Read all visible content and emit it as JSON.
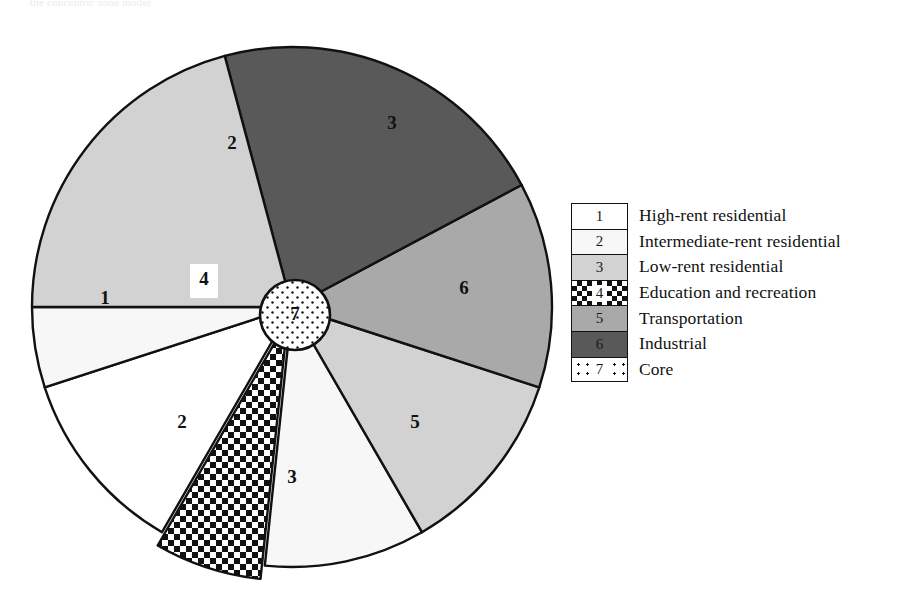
{
  "caption": "the concentric zone model",
  "chart_data": {
    "type": "pie",
    "center_label": "7",
    "core_category": "Core",
    "categories": [
      "1",
      "2",
      "3",
      "4",
      "5",
      "6",
      "7"
    ],
    "legend_position": "right",
    "grid": false,
    "sectors": [
      {
        "id": "1",
        "label": "High-rent residential",
        "start_deg": 210,
        "end_deg": 252,
        "value": 42,
        "fill": "#ffffff",
        "pattern": "solid",
        "label_x": 105,
        "label_y": 300
      },
      {
        "id": "2",
        "label": "Intermediate-rent residential",
        "start_deg": 252,
        "end_deg": 270,
        "value": 18,
        "fill": "#f7f7f7",
        "pattern": "solid",
        "label_x": 232,
        "label_y": 145
      },
      {
        "id": "4",
        "label": "Education and recreation",
        "start_deg": 186,
        "end_deg": 210,
        "value": 24,
        "fill": "#ffffff",
        "pattern": "checker",
        "label_x": 204,
        "label_y": 281,
        "exploded": true
      },
      {
        "id": "2b",
        "label": "Intermediate-rent residential",
        "start_deg": 150,
        "end_deg": 186,
        "value": 36,
        "fill": "#f7f7f7",
        "pattern": "solid",
        "label_x": 182,
        "label_y": 424
      },
      {
        "id": "3b",
        "label": "Low-rent residential",
        "start_deg": 108,
        "end_deg": 150,
        "value": 42,
        "fill": "#d2d2d2",
        "pattern": "solid",
        "label_x": 292,
        "label_y": 479
      },
      {
        "id": "5",
        "label": "Transportation",
        "start_deg": 62,
        "end_deg": 108,
        "value": 46,
        "fill": "#a9a9a9",
        "pattern": "solid",
        "label_x": 415,
        "label_y": 424
      },
      {
        "id": "6",
        "label": "Industrial",
        "start_deg": 345,
        "end_deg": 62,
        "value": 77,
        "fill": "#595959",
        "pattern": "solid",
        "label_x": 464,
        "label_y": 290
      },
      {
        "id": "3",
        "label": "Low-rent residential",
        "start_deg": 270,
        "end_deg": 345,
        "value": 75,
        "fill": "#d2d2d2",
        "pattern": "solid",
        "label_x": 392,
        "label_y": 125
      }
    ],
    "geometry": {
      "cx": 292,
      "cy": 307,
      "r": 260,
      "core_cx": 295,
      "core_cy": 315,
      "core_r": 35,
      "explode_offset": 14
    }
  },
  "legend": {
    "items": [
      {
        "key": "1",
        "label": "High-rent residential",
        "fill_class": "f-white"
      },
      {
        "key": "2",
        "label": "Intermediate-rent residential",
        "fill_class": "f-offwhite"
      },
      {
        "key": "3",
        "label": "Low-rent residential",
        "fill_class": "f-light"
      },
      {
        "key": "4",
        "label": "Education and recreation",
        "fill_class": "patt-check"
      },
      {
        "key": "5",
        "label": "Transportation",
        "fill_class": "f-mid"
      },
      {
        "key": "6",
        "label": "Industrial",
        "fill_class": "f-dark"
      },
      {
        "key": "7",
        "label": "Core",
        "fill_class": "patt-dot"
      }
    ]
  },
  "colors": {
    "outline": "#111111",
    "light_gray": "#d2d2d2",
    "mid_gray": "#a9a9a9",
    "dark_gray": "#595959",
    "off_white": "#f7f7f7",
    "white": "#ffffff"
  }
}
